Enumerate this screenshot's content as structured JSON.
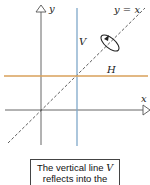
{
  "diagram": {
    "axis_labels": {
      "x": "x",
      "y": "y"
    },
    "diagonal_label": "y = x",
    "vertical_line_label": "V",
    "horizontal_line_label": "H",
    "colors": {
      "axes": "#555555",
      "vertical_line": "#7fa8c9",
      "horizontal_line": "#d9a15a",
      "diagonal": "#333333"
    },
    "geometry": {
      "origin": [
        41,
        110
      ],
      "vertical_line_x": 77,
      "horizontal_line_y": 77
    }
  },
  "caption": {
    "line1_prefix": "The vertical line ",
    "line1_var": "V",
    "line2": "reflects into the",
    "line3_prefix": "horizontal line ",
    "line3_var": "H"
  }
}
